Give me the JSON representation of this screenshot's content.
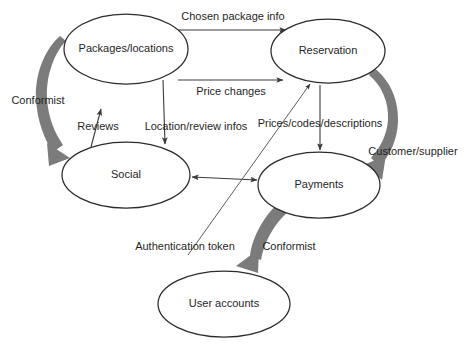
{
  "diagram": {
    "type": "context-map",
    "background_color": "#ffffff",
    "node_stroke_color": "#2b2b2b",
    "edge_color": "#3a3a3a",
    "relationship_arrow_color": "#7b7b7b",
    "nodes": [
      {
        "id": "packages",
        "label": "Packages/locations",
        "cx": 126,
        "cy": 49,
        "rx": 62,
        "ry": 35
      },
      {
        "id": "reservation",
        "label": "Reservation",
        "cx": 328,
        "cy": 51,
        "rx": 57,
        "ry": 32
      },
      {
        "id": "social",
        "label": "Social",
        "cx": 126,
        "cy": 175,
        "rx": 64,
        "ry": 33
      },
      {
        "id": "payments",
        "label": "Payments",
        "cx": 319,
        "cy": 185,
        "rx": 61,
        "ry": 33
      },
      {
        "id": "user_accounts",
        "label": "User accounts",
        "cx": 224,
        "cy": 304,
        "rx": 66,
        "ry": 33
      }
    ],
    "edges": [
      {
        "id": "chosen-package-info",
        "label": "Chosen package info",
        "from": "packages",
        "to": "reservation",
        "label_x": 233,
        "label_y": 17,
        "style": "thin-arrow"
      },
      {
        "id": "price-changes",
        "label": "Price changes",
        "from": "packages",
        "to": "reservation",
        "label_x": 231,
        "label_y": 92,
        "style": "thin-arrow"
      },
      {
        "id": "reviews",
        "label": "Reviews",
        "from": "social",
        "to": "packages",
        "label_x": 98,
        "label_y": 127,
        "style": "thin-arrow"
      },
      {
        "id": "location-review-infos",
        "label": "Location/review infos",
        "from": "packages",
        "to": "social",
        "label_x": 196,
        "label_y": 127,
        "style": "thin-arrow"
      },
      {
        "id": "prices-codes-descriptions",
        "label": "Prices/codes/descriptions",
        "from": "reservation",
        "to": "payments",
        "label_x": 320,
        "label_y": 124,
        "style": "thin-arrow"
      },
      {
        "id": "social-payments",
        "label": "",
        "from": "social",
        "to": "payments",
        "style": "thin-double-arrow"
      },
      {
        "id": "authentication-token",
        "label": "Authentication token",
        "from": "user_accounts",
        "to": "reservation",
        "label_x": 185,
        "label_y": 247,
        "style": "thin-arrow"
      }
    ],
    "relationship_arrows": [
      {
        "id": "conformist-left",
        "label": "Conformist",
        "from": "packages",
        "to": "social",
        "label_x": 38,
        "label_y": 101
      },
      {
        "id": "customer-supplier-right",
        "label": "Customer/supplier",
        "from": "reservation",
        "to": "payments",
        "label_x": 413,
        "label_y": 152
      },
      {
        "id": "conformist-bottom",
        "label": "Conformist",
        "from": "payments",
        "to": "user_accounts",
        "label_x": 289,
        "label_y": 247
      }
    ]
  }
}
